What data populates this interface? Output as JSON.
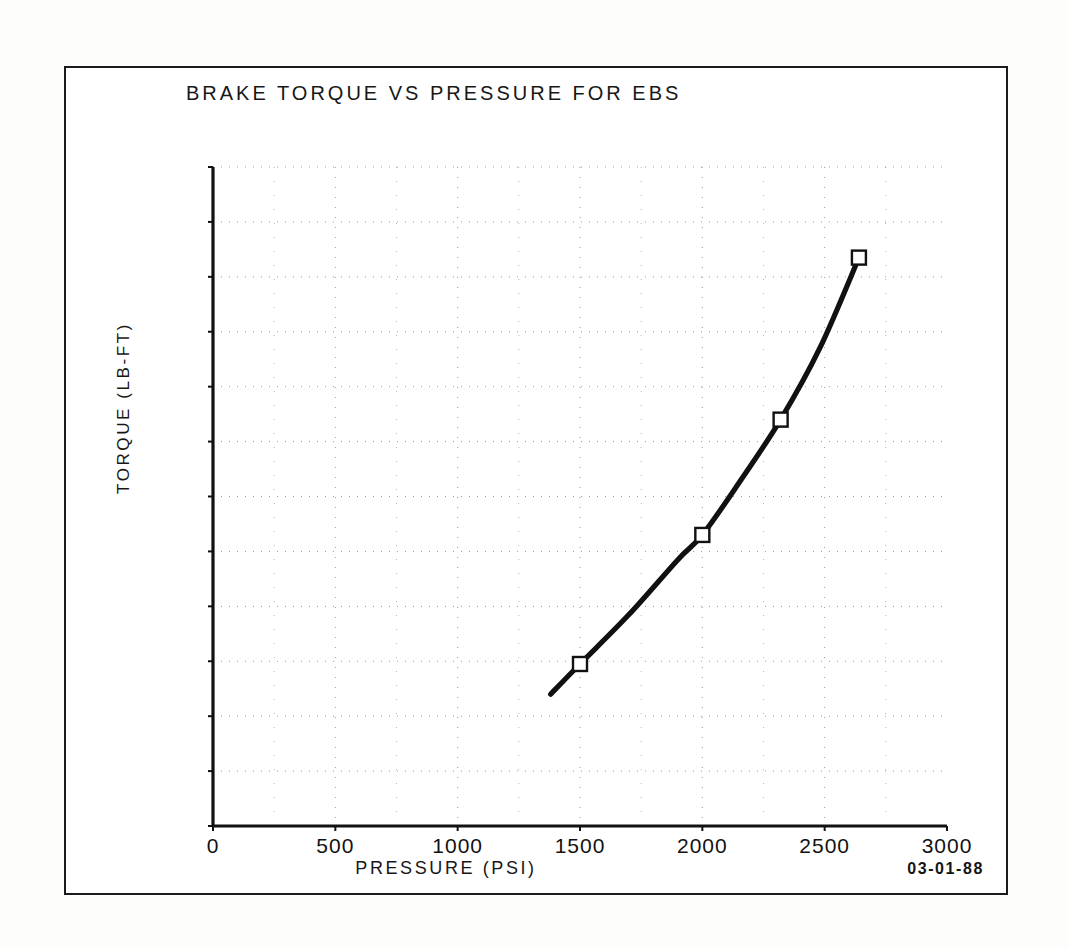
{
  "document": {
    "kind": "engineering-plot-scan",
    "date_stamp": "03-01-88"
  },
  "chart_data": {
    "type": "line",
    "title": "BRAKE TORQUE VS PRESSURE FOR EBS",
    "xlabel": "PRESSURE (PSI)",
    "ylabel": "TORQUE (LB-FT)",
    "xlim": [
      0,
      3000
    ],
    "ylim": [
      0,
      12000
    ],
    "xticks": [
      0,
      500,
      1000,
      1500,
      2000,
      2500,
      3000
    ],
    "yticks": [
      0,
      1000,
      2000,
      3000,
      4000,
      5000,
      6000,
      7000,
      8000,
      9000,
      10000,
      11000,
      12000
    ],
    "xtick_labels": [
      "0",
      "500",
      "1000",
      "1500",
      "2000",
      "2500",
      "3000"
    ],
    "ytick_labels": [
      "0",
      "1000",
      "2000",
      "3000",
      "4000",
      "5000",
      "6000",
      "7000",
      "8000",
      "9000",
      "10000",
      "11000",
      "12000"
    ],
    "grid": true,
    "grid_style": "dotted",
    "grid_minor_x_step": 250,
    "grid_major_y_step": 1000,
    "legend": null,
    "marker": "open-square",
    "line_color": "#000000",
    "series": [
      {
        "name": "EBS brake torque",
        "marker": "open-square",
        "points": [
          {
            "x": 1500,
            "y": 2950
          },
          {
            "x": 2000,
            "y": 5300
          },
          {
            "x": 2320,
            "y": 7400
          },
          {
            "x": 2640,
            "y": 10350
          }
        ],
        "curve_x": [
          1380,
          1500,
          1700,
          1900,
          2000,
          2150,
          2320,
          2480,
          2640
        ],
        "curve_y": [
          2400,
          2950,
          3850,
          4850,
          5300,
          6250,
          7400,
          8700,
          10350
        ]
      }
    ]
  },
  "colors": {
    "ink": "#111111",
    "paper": "#ffffff",
    "page": "#fdfdfc",
    "grid": "#8a8a8a"
  }
}
